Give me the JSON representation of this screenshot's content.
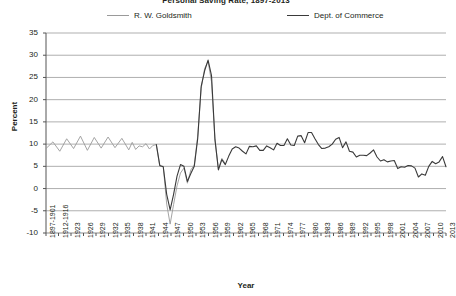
{
  "chart_data": {
    "type": "line",
    "title": "Personal Saving Rate, 1897-2013",
    "xlabel": "Year",
    "ylabel": "Percent",
    "ylim": [
      -10,
      35
    ],
    "yticks": [
      35,
      30,
      25,
      20,
      15,
      10,
      5,
      0,
      -5,
      -10
    ],
    "grid": true,
    "legend_position": "top",
    "xticks": [
      "1897-1901",
      "1912-1916",
      "1923",
      "1926",
      "1929",
      "1932",
      "1935",
      "1938",
      "1941",
      "1944",
      "1947",
      "1950",
      "1953",
      "1956",
      "1959",
      "1962",
      "1965",
      "1968",
      "1971",
      "1974",
      "1977",
      "1980",
      "1983",
      "1986",
      "1989",
      "1992",
      "1995",
      "1998",
      "2001",
      "2004",
      "2007",
      "2010",
      "2013"
    ],
    "series": [
      {
        "name": "R. W. Goldsmith",
        "color": "#9a9a9a",
        "x": [
          1897,
          1899,
          1901,
          1903,
          1905,
          1907,
          1909,
          1911,
          1913,
          1915,
          1917,
          1919,
          1921,
          1922,
          1923,
          1924,
          1925,
          1926,
          1927,
          1928,
          1929,
          1930,
          1931,
          1932,
          1933,
          1934,
          1935,
          1936,
          1937,
          1938,
          1939,
          1940,
          1941,
          1942,
          1943,
          1944,
          1945,
          1946,
          1947,
          1948,
          1949
        ],
        "values": [
          9.0,
          10.5,
          8.4,
          11.2,
          9.0,
          11.8,
          8.6,
          11.5,
          9.1,
          11.6,
          9.2,
          11.3,
          8.7,
          10.4,
          8.8,
          9.6,
          9.4,
          10.1,
          8.9,
          9.7,
          9.9,
          5.0,
          5.0,
          -3.5,
          -8.0,
          -3.6,
          0.6,
          3.5,
          4.6,
          1.2,
          4.2,
          5.3,
          11.8,
          22.5,
          27.0,
          28.6,
          24.0,
          11.0,
          4.4,
          6.8,
          5.6
        ]
      },
      {
        "name": "Dept. of Commerce",
        "color": "#3a3a3a",
        "x": [
          1929,
          1930,
          1931,
          1932,
          1933,
          1934,
          1935,
          1936,
          1937,
          1938,
          1939,
          1940,
          1941,
          1942,
          1943,
          1944,
          1945,
          1946,
          1947,
          1948,
          1949,
          1950,
          1951,
          1952,
          1953,
          1954,
          1955,
          1956,
          1957,
          1958,
          1959,
          1960,
          1961,
          1962,
          1963,
          1964,
          1965,
          1966,
          1967,
          1968,
          1969,
          1970,
          1971,
          1972,
          1973,
          1974,
          1975,
          1976,
          1977,
          1978,
          1979,
          1980,
          1981,
          1982,
          1983,
          1984,
          1985,
          1986,
          1987,
          1988,
          1989,
          1990,
          1991,
          1992,
          1993,
          1994,
          1995,
          1996,
          1997,
          1998,
          1999,
          2000,
          2001,
          2002,
          2003,
          2004,
          2005,
          2006,
          2007,
          2008,
          2009,
          2010,
          2011,
          2012,
          2013
        ],
        "values": [
          9.9,
          5.2,
          4.9,
          -1.3,
          -4.8,
          -1.3,
          2.8,
          5.4,
          5.0,
          1.6,
          3.4,
          5.0,
          11.3,
          23.0,
          26.5,
          28.9,
          25.4,
          11.0,
          4.2,
          6.5,
          5.4,
          7.3,
          8.9,
          9.4,
          9.1,
          8.4,
          7.8,
          9.5,
          9.4,
          9.6,
          8.6,
          8.6,
          9.6,
          9.2,
          8.7,
          10.2,
          9.7,
          9.7,
          11.2,
          9.8,
          9.7,
          11.8,
          11.9,
          10.3,
          12.6,
          12.6,
          11.2,
          9.9,
          9.0,
          9.1,
          9.4,
          10.0,
          11.1,
          11.5,
          9.2,
          10.5,
          8.4,
          8.2,
          7.1,
          7.5,
          7.5,
          7.4,
          8.0,
          8.7,
          7.1,
          6.2,
          6.5,
          6.0,
          6.2,
          6.3,
          4.5,
          4.9,
          4.8,
          5.2,
          5.1,
          4.6,
          2.6,
          3.3,
          3.0,
          5.0,
          6.1,
          5.6,
          6.0,
          7.2,
          4.9
        ]
      }
    ]
  },
  "axes": {
    "percent_label": "Percent",
    "year_label": "Year"
  }
}
